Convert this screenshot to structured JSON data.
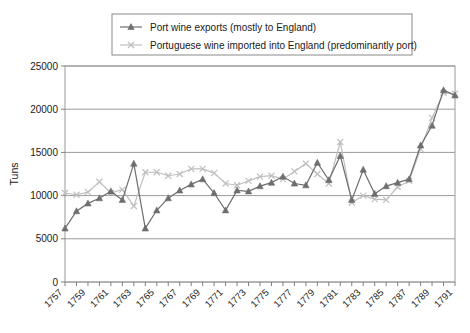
{
  "chart_data": {
    "type": "line",
    "title": "",
    "xlabel": "",
    "ylabel": "Tuns",
    "ylim": [
      0,
      25000
    ],
    "ytick_values": [
      0,
      5000,
      10000,
      15000,
      20000,
      25000
    ],
    "ytick_labels": [
      "0",
      "5000",
      "10000",
      "15000",
      "20000",
      "25000"
    ],
    "xlim": [
      1757,
      1791
    ],
    "x": [
      1757,
      1758,
      1759,
      1760,
      1761,
      1762,
      1763,
      1764,
      1765,
      1766,
      1767,
      1768,
      1769,
      1770,
      1771,
      1772,
      1773,
      1774,
      1775,
      1776,
      1777,
      1778,
      1779,
      1780,
      1781,
      1782,
      1783,
      1784,
      1785,
      1786,
      1787,
      1788,
      1789,
      1790,
      1791
    ],
    "xtick_labels": [
      "1757",
      "1759",
      "1761",
      "1763",
      "1765",
      "1767",
      "1769",
      "1771",
      "1773",
      "1775",
      "1777",
      "1779",
      "1781",
      "1783",
      "1785",
      "1787",
      "1789",
      "1791"
    ],
    "xtick_label_values": [
      1757,
      1759,
      1761,
      1763,
      1765,
      1767,
      1769,
      1771,
      1773,
      1775,
      1777,
      1779,
      1781,
      1783,
      1785,
      1787,
      1789,
      1791
    ],
    "grid": true,
    "grid_axis": "y",
    "legend_position": "top-center",
    "series": [
      {
        "name": "Port wine exports (mostly to England)",
        "color": "#6e6e6e",
        "marker": "triangle",
        "values": [
          6200,
          8200,
          9100,
          9700,
          10500,
          9500,
          13700,
          6200,
          8300,
          9700,
          10600,
          11300,
          11900,
          10300,
          8300,
          10600,
          10500,
          11100,
          11500,
          12200,
          11400,
          11200,
          13800,
          11800,
          14600,
          9500,
          13000,
          10200,
          11100,
          11500,
          11900,
          15800,
          18100,
          22200,
          21600
        ]
      },
      {
        "name": "Portuguese wine imported into England (predominantly port)",
        "color": "#bfbfbf",
        "marker": "x",
        "values": [
          10300,
          10100,
          10400,
          11600,
          10300,
          10700,
          8800,
          12700,
          12700,
          12300,
          12500,
          13100,
          13100,
          12600,
          11400,
          11200,
          11700,
          12200,
          12300,
          11900,
          12800,
          13700,
          12500,
          11400,
          16200,
          9200,
          10000,
          9600,
          9500,
          11000,
          11700,
          15400,
          19000,
          21900,
          21800
        ]
      }
    ]
  },
  "legend": {
    "entries": [
      {
        "label": "Port wine exports (mostly to England)"
      },
      {
        "label": "Portuguese wine imported into England (predominantly port)"
      }
    ]
  },
  "axis": {
    "y_title": "Tuns"
  }
}
